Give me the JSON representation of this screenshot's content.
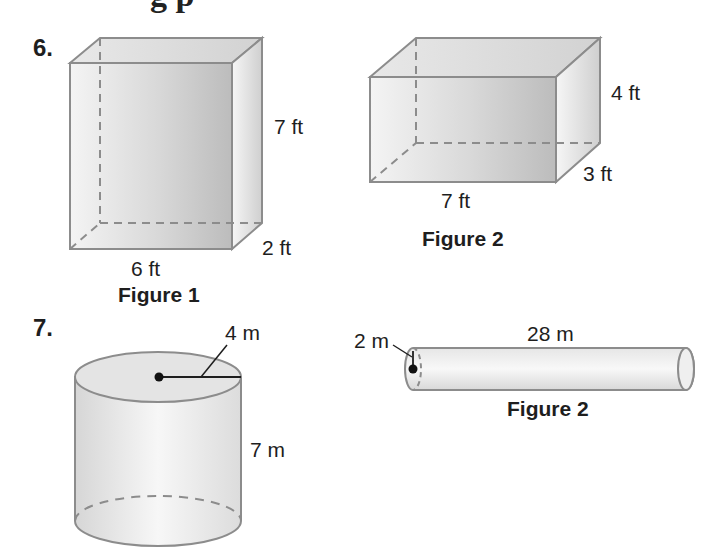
{
  "page": {
    "partial_heading_clipped": "g                     p"
  },
  "problems": [
    {
      "number": "6.",
      "figures": [
        {
          "shape": "rectangular-prism",
          "caption": "Figure 1",
          "dimensions": {
            "height": "7 ft",
            "depth": "2 ft",
            "width": "6 ft"
          }
        },
        {
          "shape": "rectangular-prism",
          "caption": "Figure 2",
          "dimensions": {
            "height": "4 ft",
            "depth": "3 ft",
            "width": "7 ft"
          }
        }
      ]
    },
    {
      "number": "7.",
      "figures": [
        {
          "shape": "cylinder",
          "caption": "",
          "dimensions": {
            "radius": "4 m",
            "height": "7 m"
          }
        },
        {
          "shape": "cylinder",
          "caption": "Figure 2",
          "dimensions": {
            "radius": "2 m",
            "length": "28 m"
          }
        }
      ]
    }
  ],
  "colors": {
    "edge": "#8c8c8c",
    "dashed_edge": "#8c8c8c",
    "face_light": "#f2f2f2",
    "face_mid": "#d9d9d9",
    "face_dark": "#bfbfbf",
    "text": "#1e1e1e"
  }
}
